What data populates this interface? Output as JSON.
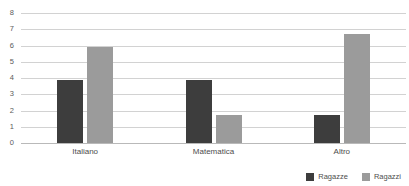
{
  "chart_data": {
    "type": "bar",
    "title": "",
    "subtitle": "",
    "xlabel": "",
    "ylabel": "",
    "categories": [
      "Italiano",
      "Matematica",
      "Altro"
    ],
    "series": [
      {
        "name": "Ragazze",
        "color": "#3d3d3d",
        "values": [
          3.9,
          3.9,
          1.7
        ]
      },
      {
        "name": "Ragazzi",
        "color": "#9b9b9b",
        "values": [
          5.9,
          1.7,
          6.7
        ]
      }
    ],
    "ylim": [
      0,
      8
    ],
    "ytick_labels": [
      "8",
      "7",
      "6",
      "5",
      "4",
      "3",
      "2",
      "1",
      "0"
    ],
    "ytick_values": [
      8,
      7,
      6,
      5,
      4,
      3,
      2,
      1,
      0
    ],
    "grid": true,
    "grid_color": "#d2d2d2",
    "axis_color": "#b9b9b9",
    "background": "#ffffff",
    "legend_position": "bottom-right",
    "legend_entries": [
      "Ragazze",
      "Ragazzi"
    ]
  }
}
